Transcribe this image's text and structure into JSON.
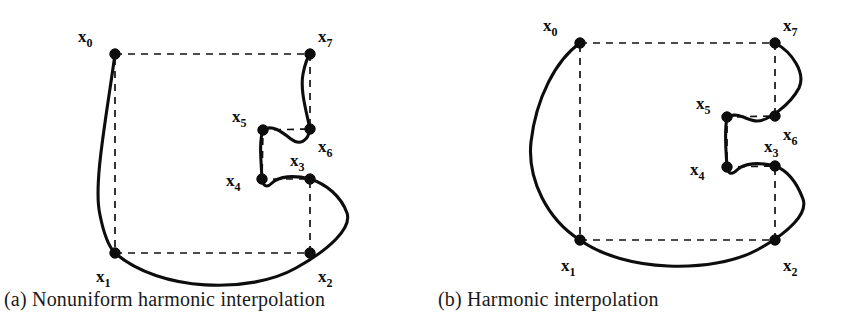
{
  "figure": {
    "background": "#ffffff",
    "ink_color": "#0d0d0d",
    "panels": [
      {
        "id": "a",
        "caption": "(a) Nonuniform harmonic interpolation",
        "points": [
          {
            "name": "x0",
            "label": "x",
            "sub": "0",
            "x": 115,
            "y": 54,
            "label_x": 78,
            "label_y": 42
          },
          {
            "name": "x1",
            "label": "x",
            "sub": "1",
            "x": 115,
            "y": 253,
            "label_x": 96,
            "label_y": 282
          },
          {
            "name": "x2",
            "label": "x",
            "sub": "2",
            "x": 310,
            "y": 253,
            "label_x": 318,
            "label_y": 282
          },
          {
            "name": "x3",
            "label": "x",
            "sub": "3",
            "x": 310,
            "y": 179,
            "label_x": 290,
            "label_y": 166
          },
          {
            "name": "x4",
            "label": "x",
            "sub": "4",
            "x": 262,
            "y": 179,
            "label_x": 226,
            "label_y": 186
          },
          {
            "name": "x5",
            "label": "x",
            "sub": "5",
            "x": 263,
            "y": 130,
            "label_x": 232,
            "label_y": 122
          },
          {
            "name": "x6",
            "label": "x",
            "sub": "6",
            "x": 310,
            "y": 129,
            "label_x": 318,
            "label_y": 152
          },
          {
            "name": "x7",
            "label": "x",
            "sub": "7",
            "x": 310,
            "y": 54,
            "label_x": 318,
            "label_y": 42
          }
        ],
        "guide_polygon": "M115,54 L310,54 L310,129 L263,130 L262,179 L310,179 L310,253 L115,253 Z",
        "curve": "M115,54 C106,120 93,185 100,215 C105,240 110,248 115,253 C160,292 250,294 296,268 C330,249 352,228 347,213 C341,196 326,184 310,179 C294,175 279,176 272,183 C266,189 263,185 262,179 C261,160 259,141 263,130 C272,124 282,132 291,139 C300,146 308,141 310,129 C306,110 300,90 303,74 C305,64 307,58 310,54"
      },
      {
        "id": "b",
        "caption": "(b) Harmonic interpolation",
        "points": [
          {
            "name": "x0",
            "label": "x",
            "sub": "0",
            "x": 580,
            "y": 43,
            "label_x": 543,
            "label_y": 31
          },
          {
            "name": "x1",
            "label": "x",
            "sub": "1",
            "x": 580,
            "y": 240,
            "label_x": 561,
            "label_y": 271
          },
          {
            "name": "x2",
            "label": "x",
            "sub": "2",
            "x": 775,
            "y": 240,
            "label_x": 783,
            "label_y": 271
          },
          {
            "name": "x3",
            "label": "x",
            "sub": "3",
            "x": 775,
            "y": 166,
            "label_x": 764,
            "label_y": 152
          },
          {
            "name": "x4",
            "label": "x",
            "sub": "4",
            "x": 727,
            "y": 167,
            "label_x": 690,
            "label_y": 175
          },
          {
            "name": "x5",
            "label": "x",
            "sub": "5",
            "x": 727,
            "y": 117,
            "label_x": 696,
            "label_y": 109
          },
          {
            "name": "x6",
            "label": "x",
            "sub": "6",
            "x": 775,
            "y": 116,
            "label_x": 783,
            "label_y": 140
          },
          {
            "name": "x7",
            "label": "x",
            "sub": "7",
            "x": 775,
            "y": 43,
            "label_x": 783,
            "label_y": 31
          }
        ],
        "guide_polygon": "M580,43 L775,43 L775,116 L727,117 L727,167 L775,166 L775,240 L580,240 Z",
        "curve": "M580,43 C556,60 536,98 531,142 C527,180 548,220 580,240 C624,272 712,274 757,250 C790,232 808,213 803,199 C797,183 789,171 775,166 C759,162 744,163 737,170 C731,176 728,173 727,167 C726,150 724,133 727,117 C737,111 748,121 757,121 C768,121 790,105 799,88 C806,73 792,52 775,43"
      }
    ]
  }
}
